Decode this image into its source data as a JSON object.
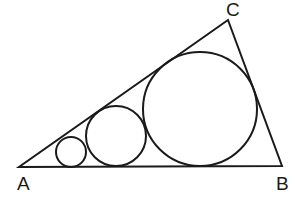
{
  "diagram": {
    "type": "geometry",
    "stroke_color": "#1a1a1a",
    "triangle": {
      "vertices": [
        {
          "label": "A",
          "x": 19,
          "y": 167
        },
        {
          "label": "B",
          "x": 282,
          "y": 166
        },
        {
          "label": "C",
          "x": 228,
          "y": 20
        }
      ]
    },
    "circles": [
      {
        "name": "small",
        "cx": 71,
        "cy": 152,
        "r": 15
      },
      {
        "name": "medium",
        "cx": 116,
        "cy": 136,
        "r": 30
      },
      {
        "name": "large",
        "cx": 200,
        "cy": 109,
        "r": 57
      }
    ],
    "labels": {
      "A": "A",
      "B": "B",
      "C": "C"
    }
  }
}
